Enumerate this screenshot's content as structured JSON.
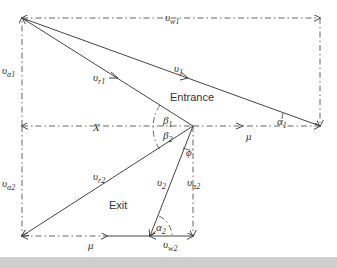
{
  "diagram": {
    "regions": {
      "entrance_label": "Entrance",
      "exit_label": "Exit"
    },
    "labels": {
      "vw1": {
        "main": "υ",
        "sub": "w1"
      },
      "va1": {
        "main": "υ",
        "sub": "α1"
      },
      "vr1": {
        "main": "υ",
        "sub": "r1"
      },
      "v1": {
        "main": "υ",
        "sub": "1"
      },
      "alpha1": {
        "main": "α",
        "sub": "1"
      },
      "beta1": {
        "main": "β",
        "sub": "1"
      },
      "beta2": {
        "main": "β",
        "sub": "2"
      },
      "X": "X",
      "mu_top": "μ",
      "phi": "ϕ",
      "va2_left": {
        "main": "υ",
        "sub": "α2"
      },
      "vr2": {
        "main": "υ",
        "sub": "r2"
      },
      "v2": {
        "main": "υ",
        "sub": "2"
      },
      "va2_right": {
        "main": "υ",
        "sub": "α2"
      },
      "alpha2": {
        "main": "α",
        "sub": "2"
      },
      "mu_bottom": "μ",
      "vw2": {
        "main": "υ",
        "sub": "w2"
      }
    },
    "colors": {
      "line": "#444444",
      "dashed": "#666666",
      "text": "#333333",
      "band": "#cfcfcf"
    }
  }
}
